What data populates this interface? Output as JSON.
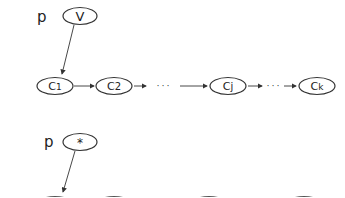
{
  "diagram": {
    "top": {
      "pointer_label": "p",
      "pointer_value": "V",
      "chain": [
        {
          "label": "C",
          "sub": "1"
        },
        {
          "label": "C",
          "sub": "2"
        },
        {
          "label": "C",
          "sub": "j"
        },
        {
          "label": "C",
          "sub": "k"
        }
      ],
      "ellipsis": "· · ·"
    },
    "bottom": {
      "pointer_label": "p",
      "pointer_value": "*"
    },
    "colors": {
      "stroke": "#333333",
      "text": "#222222",
      "background": "#ffffff"
    }
  }
}
